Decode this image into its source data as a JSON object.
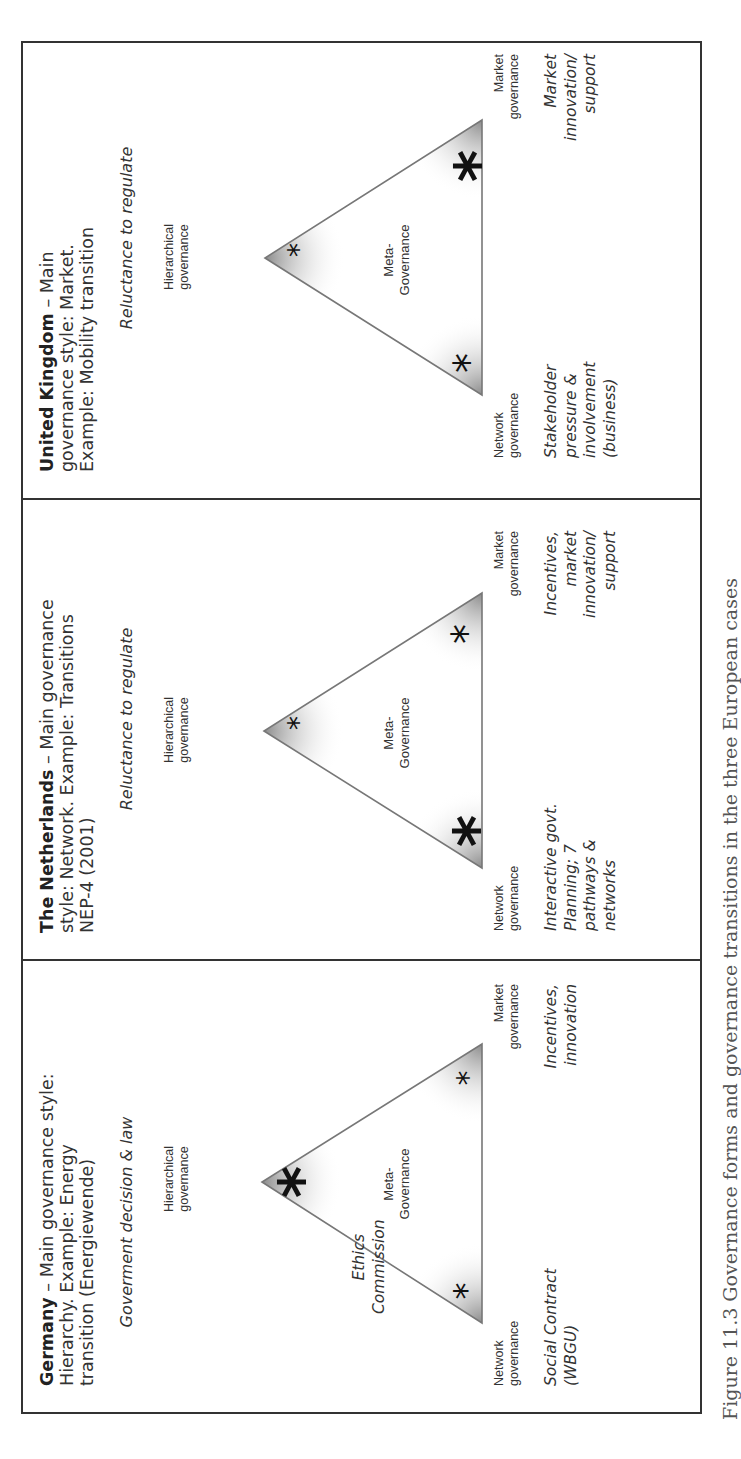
{
  "figure": {
    "caption": "Figure 11.3 Governance forms and governance transitions in the three European cases",
    "orientation": "rotated 90 degrees counter-clockwise",
    "vertex_labels": {
      "hierarchical": [
        "Hierarchical",
        "governance"
      ],
      "network": [
        "Network",
        "governance"
      ],
      "market": [
        "Market",
        "governance"
      ],
      "center": [
        "Meta-",
        "Governance"
      ]
    },
    "panels": [
      {
        "country": "Germany",
        "title_rest": " – Main governance style: Hierarchy. Example: Energy transition (Energiewende)",
        "top_note": "Goverment decision & law",
        "side_note": [
          "Ethics",
          "Commission"
        ],
        "network_desc": [
          "Social Contract",
          "(WBGU)"
        ],
        "market_desc": [
          "Incentives,",
          "innovation"
        ],
        "emphasis": {
          "hierarchical": "large",
          "network": "small",
          "market": "small"
        }
      },
      {
        "country": "The Netherlands",
        "title_rest": " – Main governance style: Network. Example: Transitions NEP-4 (2001)",
        "top_note": "Reluctance to regulate",
        "network_desc": [
          "Interactive govt.",
          "Planning; 7",
          "pathways &",
          "networks"
        ],
        "market_desc": [
          "Incentives,",
          "market",
          "innovation/",
          "support"
        ],
        "emphasis": {
          "hierarchical": "small",
          "network": "large",
          "market": "medium"
        }
      },
      {
        "country": "United Kingdom",
        "title_rest": " – Main governance style: Market. Example: Mobility transition",
        "top_note": "Reluctance to regulate",
        "network_desc": [
          "Stakeholder",
          "pressure &",
          "involvement",
          "(business)"
        ],
        "market_desc": [
          "Market",
          "innovation/",
          "support"
        ],
        "emphasis": {
          "hierarchical": "small",
          "network": "medium",
          "market": "large"
        }
      }
    ],
    "colors": {
      "border": "#333333",
      "triangle_edge": "#777777",
      "corner_shade": "#8c8c8c",
      "text": "#333333"
    }
  }
}
